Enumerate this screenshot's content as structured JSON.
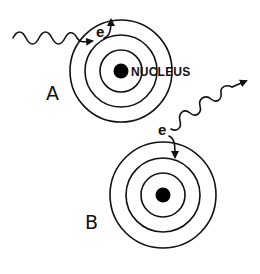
{
  "diagram": {
    "title": "",
    "colors": {
      "stroke": "#111111",
      "nucleus": "#000000",
      "background": "#ffffff"
    },
    "atoms": [
      {
        "id": "A",
        "label": "A",
        "center": [
          121,
          71
        ],
        "orbit_radii": [
          21,
          36,
          51
        ],
        "nucleus_radius": 7.5,
        "nucleus_label": "NUCLEUS",
        "process": "absorption",
        "electron_label": "e",
        "electron_transition": "inner orbit (2nd) to outer orbit (3rd) — arrow pointing outward",
        "photon": {
          "direction": "incoming",
          "label": "wavy arrow from left into atom"
        }
      },
      {
        "id": "B",
        "label": "B",
        "center": [
          163,
          195
        ],
        "orbit_radii": [
          22,
          37,
          53
        ],
        "nucleus_radius": 7.5,
        "nucleus_label": "",
        "process": "emission",
        "electron_label": "e",
        "electron_transition": "outer orbit (3rd) to inner orbit (2nd) — arrow pointing inward",
        "photon": {
          "direction": "outgoing",
          "label": "wavy arrow leaving atom toward upper right"
        }
      }
    ]
  }
}
